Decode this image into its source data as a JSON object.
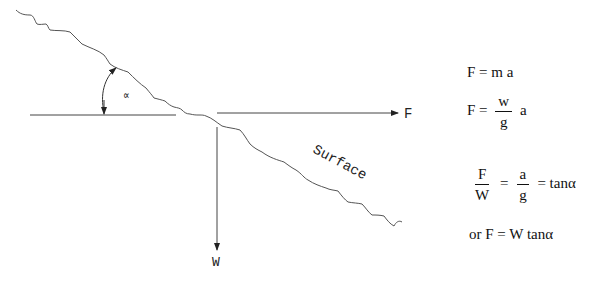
{
  "diagram": {
    "labels": {
      "angle": "∝",
      "force_horizontal": "F",
      "weight": "W",
      "surface": "Surface"
    },
    "colors": {
      "line": "#555555",
      "text": "#111111",
      "background": "#ffffff"
    }
  },
  "equations": {
    "eq1": {
      "lhs": "F",
      "eq": "=",
      "rhs": "m a"
    },
    "eq2": {
      "lhs": "F",
      "eq": "=",
      "num": "w",
      "den": "g",
      "rhs": "a"
    },
    "eq3": {
      "lhs_num": "F",
      "lhs_den": "W",
      "eq1": "=",
      "mid_num": "a",
      "mid_den": "g",
      "eq2": "=",
      "rhs": "tanα"
    },
    "eq4": {
      "text": "or F = W tanα"
    }
  }
}
